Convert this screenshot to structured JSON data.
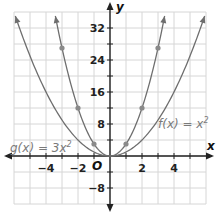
{
  "chart_data": {
    "type": "line",
    "title": "",
    "xlabel": "x",
    "ylabel": "y",
    "xlim": [
      -6,
      6
    ],
    "ylim": [
      -12,
      36
    ],
    "grid": true,
    "x_ticks": [
      -4,
      -2,
      2,
      4
    ],
    "x_tick_labels": [
      "−4",
      "−2",
      "2",
      "4"
    ],
    "y_ticks": [
      32,
      24,
      16,
      8,
      -8
    ],
    "y_tick_labels": [
      "32",
      "24",
      "16",
      "8",
      "−8"
    ],
    "origin_label": "O",
    "series": [
      {
        "name": "f(x) = x²",
        "label": "f(x) = x²",
        "formula": "x^2",
        "x": [
          -6,
          -5,
          -4,
          -3,
          -2,
          -1,
          0,
          1,
          2,
          3,
          4,
          5,
          6
        ],
        "values": [
          36,
          25,
          16,
          9,
          4,
          1,
          0,
          1,
          4,
          9,
          16,
          25,
          36
        ],
        "markers": []
      },
      {
        "name": "g(x) = 3x²",
        "label": "g(x) = 3x²",
        "formula": "3x^2",
        "x": [
          -3.46,
          -3,
          -2,
          -1,
          0,
          1,
          2,
          3,
          3.46
        ],
        "values": [
          36,
          27,
          12,
          3,
          0,
          3,
          12,
          27,
          36
        ],
        "markers": [
          [
            -3,
            27
          ],
          [
            -2,
            12
          ],
          [
            -1,
            3
          ],
          [
            1,
            3
          ],
          [
            2,
            12
          ],
          [
            3,
            27
          ]
        ]
      }
    ]
  },
  "labels": {
    "f": "f(x) = x²",
    "g": "g(x) = 3x²",
    "x_axis": "x",
    "y_axis": "y",
    "origin": "O"
  },
  "colors": {
    "curve": "#6e6e6e",
    "marker": "#8a8a8a",
    "grid": "#d6d6d6",
    "axis": "#222222"
  }
}
